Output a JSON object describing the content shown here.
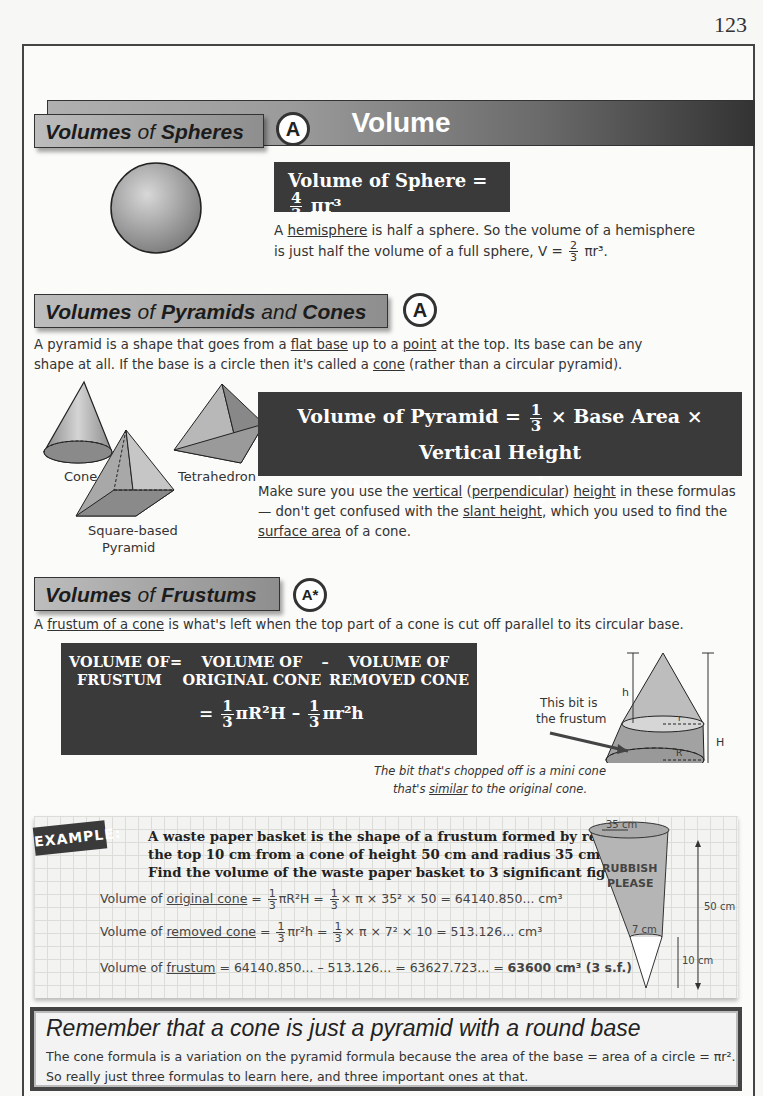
{
  "page_number": "123",
  "title": "Volume",
  "sections": {
    "spheres": {
      "heading_bold": "Volumes",
      "heading_normal": "of",
      "heading_bold2": "Spheres",
      "grade": "A",
      "formula_label": "Volume of Sphere =",
      "formula_frac_num": "4",
      "formula_frac_den": "3",
      "formula_tail": "πr³",
      "text_a": "A ",
      "text_link": "hemisphere",
      "text_b": " is half a sphere.  So the volume of a hemisphere",
      "text_line2": "is just half the volume of a full sphere, V =",
      "text_frac_num": "2",
      "text_frac_den": "3",
      "text_tail": "πr³."
    },
    "pyramids": {
      "heading_bold": "Volumes",
      "heading_normal": "of",
      "heading_bold2": "Pyramids",
      "heading_normal2": "and",
      "heading_bold3": "Cones",
      "grade": "A",
      "intro_1": "A pyramid is a shape that goes from a ",
      "intro_link1": "flat base",
      "intro_2": " up to a ",
      "intro_link2": "point",
      "intro_3": " at the top.  Its base can be any",
      "intro_4": "shape at all.  If the base is a circle then it's called a ",
      "intro_link3": "cone",
      "intro_5": " (rather than a circular pyramid).",
      "shape_labels": [
        "Cone",
        "Tetrahedron",
        "Square-based",
        "Pyramid"
      ],
      "formula1_label": "Volume of Pyramid =",
      "formula1_tail": "× Base Area × Vertical Height",
      "formula2_label": "Volume of Cone =",
      "formula2_tail": "× πr² × hᵥ",
      "frac_num": "1",
      "frac_den": "3",
      "note_1": "Make sure you use the ",
      "note_link1": "vertical",
      "note_2": " (",
      "note_link2": "perpendicular",
      "note_3": ") ",
      "note_link3": "height",
      "note_4": " in these formulas",
      "note_5": "— don't get confused with the ",
      "note_link4": "slant height",
      "note_6": ", which you used to find the",
      "note_link5": "surface area",
      "note_7": " of a cone."
    },
    "frustums": {
      "heading_bold": "Volumes",
      "heading_normal": "of",
      "heading_bold2": "Frustums",
      "grade": "A*",
      "intro_a": "A ",
      "intro_link": "frustum of a cone",
      "intro_b": " is what's left when the top part of a cone is cut off parallel to its circular base.",
      "box_col1": [
        "VOLUME OF",
        "FRUSTUM"
      ],
      "box_op1": "=",
      "box_col2": [
        "VOLUME OF",
        "ORIGINAL CONE"
      ],
      "box_op2": "–",
      "box_col3": [
        "VOLUME OF",
        "REMOVED CONE"
      ],
      "box_eq": "=",
      "box_term1": "πR²H",
      "box_minus": "–",
      "box_term2": "πr²h",
      "frac_num": "1",
      "frac_den": "3",
      "diagram_label": [
        "This bit is",
        "the frustum"
      ],
      "diagram_h": "h",
      "diagram_H": "H",
      "diagram_r": "r",
      "diagram_R": "R",
      "caption_1": "The bit that's chopped off is a mini cone",
      "caption_2a": "that's ",
      "caption_link": "similar",
      "caption_2b": " to the original cone."
    }
  },
  "example": {
    "badge": "EXAMPLE:",
    "question": [
      "A waste paper basket is the shape of a frustum formed by removing",
      "the top 10 cm from a cone of height 50 cm and radius 35 cm.",
      "Find the volume of the waste paper basket to 3 significant figures."
    ],
    "line1_pre": "Volume of ",
    "line1_link": "original cone",
    "line1_eq": " = ",
    "line1_f1": "πR²H = ",
    "line1_f2": "× π × 35² × 50 = 64140.850... cm³",
    "line2_pre": "Volume of ",
    "line2_link": "removed cone",
    "line2_eq": " = ",
    "line2_f1": "πr²h = ",
    "line2_f2": "× π × 7² × 10 = 513.126... cm³",
    "line3_pre": "Volume of ",
    "line3_link": "frustum",
    "line3_rest": " = 64140.850... – 513.126... = 63627.723... = ",
    "line3_answer": "63600 cm³ (3 s.f.)",
    "frac_num": "1",
    "frac_den": "3",
    "basket_text": [
      "RUBBISH",
      "PLEASE"
    ],
    "dim_top": "35 cm",
    "dim_bottom": "7 cm",
    "dim_height": "50 cm",
    "dim_removed": "10 cm"
  },
  "remember": {
    "heading": "Remember that a cone is just a pyramid with a round base",
    "line1": "The cone formula is a variation on the pyramid formula because the area of the base = area of a circle = πr².",
    "line2": "So really just three formulas to learn here, and three important ones at that."
  },
  "colors": {
    "dark_box": "#3a3a3a",
    "header_gradient_start": "#b0b0b0",
    "header_gradient_end": "#333333",
    "grid_bg": "#f3f3f1"
  }
}
